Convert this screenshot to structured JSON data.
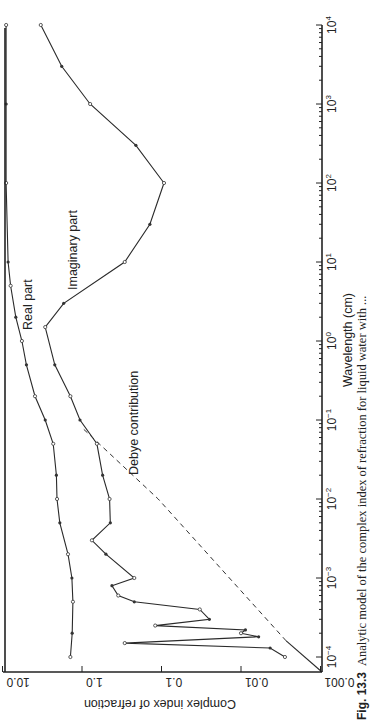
{
  "figure": {
    "caption_label": "Fig. 13.3",
    "caption_text": "Analytic model of the complex index of refraction for liquid water with ..."
  },
  "chart_data": {
    "type": "line",
    "orientation": "rotated-90-clockwise",
    "title": "",
    "xlabel": "Wavelength (cm)",
    "ylabel": "Complex index of refraction",
    "xscale": "log",
    "yscale": "log",
    "xlim": [
      0.0001,
      10000
    ],
    "ylim": [
      0.001,
      10.0
    ],
    "x_tick_labels": [
      "10^-4",
      "10^-3",
      "10^-2",
      "10^-1",
      "10^0",
      "10^1",
      "10^2",
      "10^3",
      "10^4"
    ],
    "y_tick_labels": [
      "0.001",
      "0.01",
      "0.1",
      "1.0",
      "10.0"
    ],
    "grid": false,
    "annotations": [
      "Real part",
      "Imaginary part",
      "Debye contribution"
    ],
    "series": [
      {
        "name": "Real part",
        "style": "solid with open/filled data markers",
        "x": [
          0.0001,
          0.0002,
          0.0005,
          0.001,
          0.002,
          0.005,
          0.01,
          0.02,
          0.05,
          0.1,
          0.2,
          0.5,
          1,
          2,
          5,
          10,
          100,
          1000,
          10000
        ],
        "values": [
          1.4,
          1.33,
          1.3,
          1.34,
          1.5,
          1.9,
          2.06,
          2.1,
          2.3,
          2.9,
          3.9,
          5.0,
          5.7,
          6.8,
          7.9,
          8.5,
          9.0,
          9.0,
          9.0
        ]
      },
      {
        "name": "Imaginary part",
        "style": "solid with data markers",
        "x": [
          0.0001,
          0.00013,
          0.00015,
          0.00018,
          0.0002,
          0.00022,
          0.00025,
          0.0003,
          0.0004,
          0.0005,
          0.0006,
          0.0008,
          0.001,
          0.002,
          0.003,
          0.005,
          0.01,
          0.02,
          0.05,
          0.1,
          0.2,
          0.5,
          1.5,
          3,
          10,
          30,
          100,
          300,
          1000,
          3000,
          10000
        ],
        "values": [
          0.0028,
          0.0043,
          0.29,
          0.006,
          0.01,
          0.0088,
          0.12,
          0.025,
          0.033,
          0.22,
          0.35,
          0.42,
          0.22,
          0.5,
          0.75,
          0.44,
          0.45,
          0.55,
          0.65,
          1.06,
          1.4,
          2.2,
          2.9,
          1.7,
          0.29,
          0.14,
          0.093,
          0.21,
          0.79,
          1.8,
          3.3
        ]
      },
      {
        "name": "Debye contribution",
        "style": "dashed",
        "x": [
          0.00016,
          0.001,
          0.01,
          0.08
        ],
        "values": [
          0.0027,
          0.014,
          0.11,
          1.0
        ]
      }
    ]
  }
}
